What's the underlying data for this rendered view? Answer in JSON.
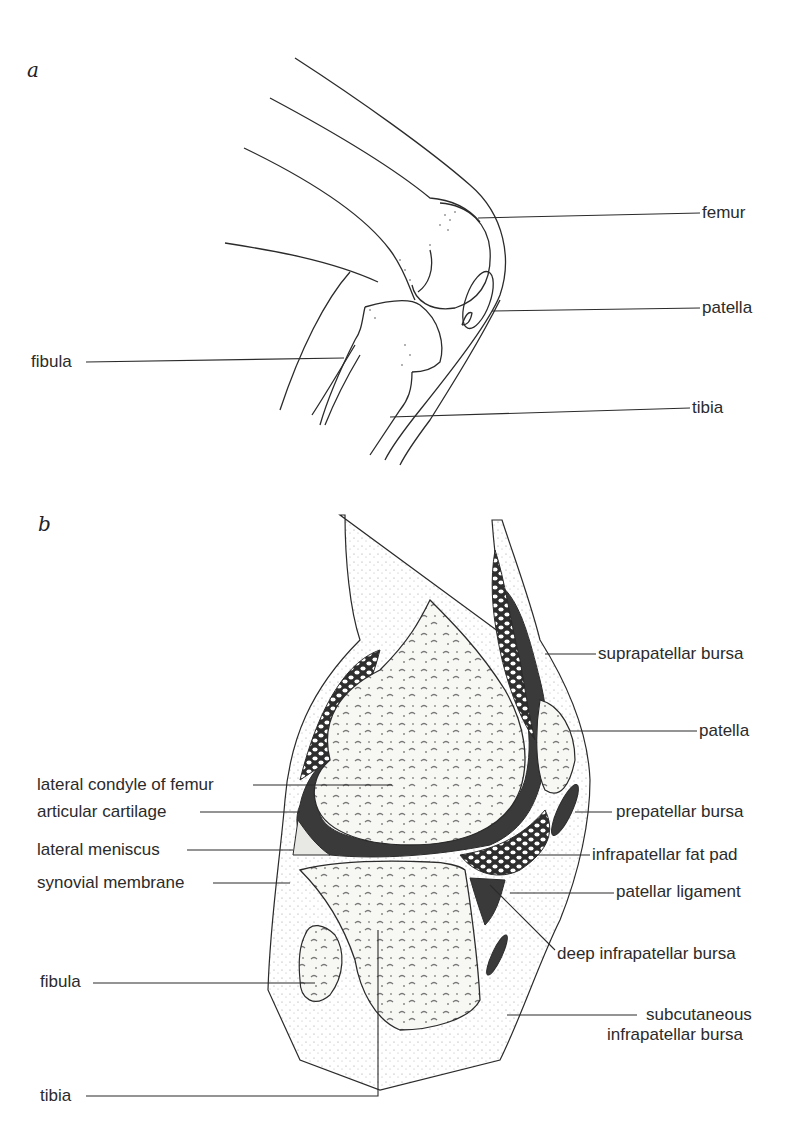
{
  "figure": {
    "panels": [
      {
        "id": "a",
        "letter": "a",
        "description": "lateral view of flexed knee",
        "labels": {
          "femur": "femur",
          "patella": "patella",
          "fibula": "fibula",
          "tibia": "tibia"
        }
      },
      {
        "id": "b",
        "letter": "b",
        "description": "sagittal section of knee joint",
        "labels": {
          "suprapatellar_bursa": "suprapatellar bursa",
          "patella": "patella",
          "lateral_condyle_of_femur": "lateral condyle of femur",
          "articular_cartilage": "articular cartilage",
          "prepatellar_bursa": "prepatellar bursa",
          "lateral_meniscus": "lateral meniscus",
          "infrapatellar_fat_pad": "infrapatellar fat pad",
          "synovial_membrane": "synovial membrane",
          "patellar_ligament": "patellar ligament",
          "deep_infrapatellar_bursa": "deep infrapatellar bursa",
          "fibula": "fibula",
          "subcutaneous_infrapatellar_bursa_line1": "subcutaneous",
          "subcutaneous_infrapatellar_bursa_line2": "infrapatellar bursa",
          "tibia": "tibia"
        }
      }
    ],
    "colors": {
      "ink": "#2b2b2b",
      "cavity": "#3a3a3a",
      "bone_fill": "#f7f7f4",
      "background": "#ffffff"
    }
  }
}
